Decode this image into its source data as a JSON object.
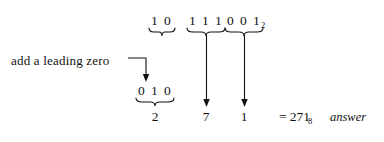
{
  "figure": {
    "ink_color": "#111111",
    "background_color": "#ffffff"
  },
  "top_row": {
    "groups": [
      {
        "id": "group-1",
        "digits": [
          "1",
          "0"
        ],
        "subscript": ""
      },
      {
        "id": "group-2",
        "digits": [
          "1",
          "1",
          "1"
        ],
        "subscript": ""
      },
      {
        "id": "group-3",
        "digits": [
          "0",
          "0",
          "1"
        ],
        "subscript": "2"
      }
    ]
  },
  "annotation": {
    "label": "add a leading zero"
  },
  "padded_row": {
    "digits": [
      "0",
      "1",
      "0"
    ]
  },
  "results": {
    "values": [
      "2",
      "7",
      "1"
    ]
  },
  "answer": {
    "equals": "=",
    "value": "271",
    "subscript": "8",
    "word": "answer"
  }
}
